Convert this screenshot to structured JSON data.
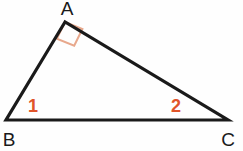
{
  "figure": {
    "kind": "right-triangle-diagram",
    "background_color": "#fefefe",
    "width": 243,
    "height": 151,
    "stroke_color": "#1a1a1a",
    "stroke_width": 3,
    "accent_color": "#e0542a",
    "right_angle_mark_color": "#e8a88c"
  },
  "vertices": {
    "a": {
      "label": "A",
      "x": 65,
      "y": 22,
      "label_x": 67,
      "label_y": 15
    },
    "b": {
      "label": "B",
      "x": 6,
      "y": 120,
      "label_x": 9,
      "label_y": 146
    },
    "c": {
      "label": "C",
      "x": 228,
      "y": 120,
      "label_x": 228,
      "label_y": 146
    }
  },
  "edges": [
    {
      "name": "side-ab",
      "from": "A",
      "to": "B"
    },
    {
      "name": "side-ac",
      "from": "A",
      "to": "C"
    },
    {
      "name": "side-bc",
      "from": "B",
      "to": "C"
    }
  ],
  "angle_marks": {
    "right_angle_at_a": {
      "name": "right-angle-square",
      "vertex": "A",
      "color": "#e8a88c",
      "points": "56.8,38.8 65.0,22.0 82.4,29.0 74.2,45.8"
    },
    "angle_one": {
      "label": "1",
      "x": 33,
      "y": 112,
      "color": "#e0542a"
    },
    "angle_two": {
      "label": "2",
      "x": 176,
      "y": 112,
      "color": "#e0542a"
    }
  },
  "chart_data": {
    "type": "diagram",
    "title": "",
    "shape": "triangle",
    "points": [
      {
        "name": "A",
        "x": 65,
        "y": 22
      },
      {
        "name": "B",
        "x": 6,
        "y": 120
      },
      {
        "name": "C",
        "x": 228,
        "y": 120
      }
    ],
    "annotations": [
      "A",
      "B",
      "C",
      "1",
      "2",
      "right-angle at A"
    ]
  }
}
